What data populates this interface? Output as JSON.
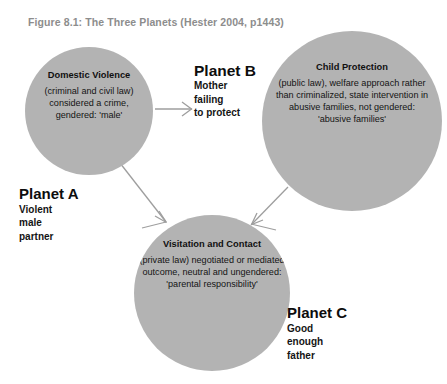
{
  "figure": {
    "caption": "Figure 8.1: The Three Planets (Hester 2004, p1443)",
    "caption_color": "#8d8d8d",
    "background_color": "#ffffff",
    "circle_fill_color": "#b3b3b3",
    "arrow_color": "#9a9a9a",
    "text_color": "#141414"
  },
  "planets": {
    "a": {
      "name": "Planet A",
      "description": "Violent\nmale\npartner",
      "circle_title": "Domestic Violence",
      "circle_body": "(criminal and civil law) considered a crime, gendered: 'male'"
    },
    "b": {
      "name": "Planet B",
      "description": "Mother\nfailing\nto protect",
      "circle_title": "Child Protection",
      "circle_body": "(public law), welfare approach rather than criminalized, state intervention in abusive families, not gendered: 'abusive families'"
    },
    "c": {
      "name": "Planet C",
      "description": "Good\nenough\nfather",
      "circle_title": "Visitation and Contact",
      "circle_body": "(private law) negotiated or mediated outcome, neutral and ungendered: 'parental responsibility'"
    }
  },
  "arrows": [
    {
      "name": "arrow-domestic-violence-to-child-protection",
      "from": "Domestic Violence",
      "to": "Child Protection"
    },
    {
      "name": "arrow-domestic-violence-to-visitation",
      "from": "Domestic Violence",
      "to": "Visitation and Contact"
    },
    {
      "name": "arrow-child-protection-to-visitation",
      "from": "Child Protection",
      "to": "Visitation and Contact"
    }
  ]
}
